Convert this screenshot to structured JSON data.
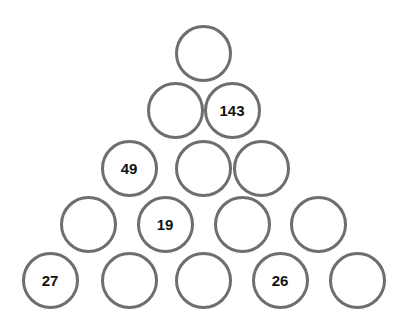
{
  "puzzle": {
    "type": "number-pyramid",
    "background_color": "#ffffff",
    "circle": {
      "diameter": 57,
      "stroke_color": "#6e6e6e",
      "stroke_width": 3,
      "fill_color": "#ffffff"
    },
    "text": {
      "color": "#121212",
      "font_size": 15
    },
    "rows": [
      {
        "index": 1,
        "cells": [
          {
            "value": "",
            "filled": false,
            "cx": 203,
            "cy": 53
          }
        ]
      },
      {
        "index": 2,
        "cells": [
          {
            "value": "",
            "filled": false,
            "cx": 175,
            "cy": 110
          },
          {
            "value": "143",
            "filled": true,
            "cx": 232,
            "cy": 110
          }
        ]
      },
      {
        "index": 3,
        "cells": [
          {
            "value": "49",
            "filled": true,
            "cx": 129,
            "cy": 168
          },
          {
            "value": "",
            "filled": false,
            "cx": 203,
            "cy": 168
          },
          {
            "value": "",
            "filled": false,
            "cx": 261,
            "cy": 168
          }
        ]
      },
      {
        "index": 4,
        "cells": [
          {
            "value": "",
            "filled": false,
            "cx": 88,
            "cy": 224
          },
          {
            "value": "19",
            "filled": true,
            "cx": 165,
            "cy": 224
          },
          {
            "value": "",
            "filled": false,
            "cx": 242,
            "cy": 224
          },
          {
            "value": "",
            "filled": false,
            "cx": 318,
            "cy": 224
          }
        ]
      },
      {
        "index": 5,
        "cells": [
          {
            "value": "27",
            "filled": true,
            "cx": 50,
            "cy": 280
          },
          {
            "value": "",
            "filled": false,
            "cx": 129,
            "cy": 280
          },
          {
            "value": "",
            "filled": false,
            "cx": 203,
            "cy": 280
          },
          {
            "value": "26",
            "filled": true,
            "cx": 280,
            "cy": 280
          },
          {
            "value": "",
            "filled": false,
            "cx": 357,
            "cy": 280
          }
        ]
      }
    ]
  }
}
